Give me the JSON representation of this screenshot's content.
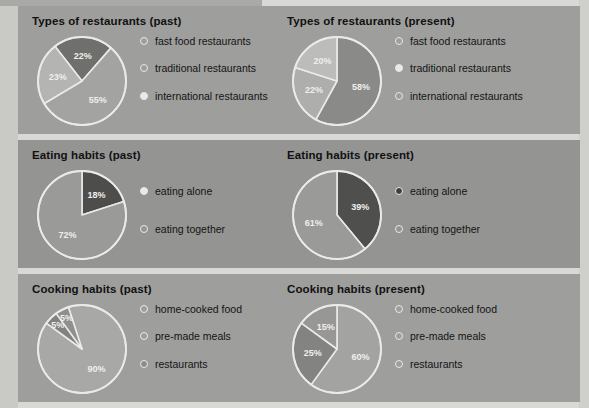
{
  "background": {
    "page_color": "#d8d8d4",
    "panel_color_a": "#9e9e9c",
    "panel_color_b": "#949492",
    "stroke_color": "#eceae6"
  },
  "panels": [
    {
      "id": "types-of-restaurants",
      "charts": [
        {
          "title": "Types of restaurants (past)",
          "chart_data": {
            "type": "pie",
            "title": "Types of restaurants (past)",
            "categories": [
              "fast food restaurants",
              "traditional restaurants",
              "international restaurants"
            ],
            "values": [
              22,
              55,
              23
            ],
            "labels": [
              "22%",
              "55%",
              "23%"
            ],
            "colors": [
              "#6f6f6d",
              "#a3a3a1",
              "#b4b4b2"
            ],
            "legend_position": "right",
            "start_angle_deg": -38
          },
          "legend": [
            {
              "label": "fast food restaurants",
              "marker": "ring"
            },
            {
              "label": "traditional restaurants",
              "marker": "ring"
            },
            {
              "label": "international restaurants",
              "marker": "ring-light"
            }
          ]
        },
        {
          "title": "Types of restaurants (present)",
          "chart_data": {
            "type": "pie",
            "title": "Types of restaurants (present)",
            "categories": [
              "fast food restaurants",
              "traditional restaurants",
              "international restaurants"
            ],
            "values": [
              58,
              22,
              20
            ],
            "labels": [
              "58%",
              "22%",
              "20%"
            ],
            "colors": [
              "#8a8a88",
              "#aeaeac",
              "#bcbcba"
            ],
            "legend_position": "right",
            "start_angle_deg": 0
          },
          "legend": [
            {
              "label": "fast food restaurants",
              "marker": "ring"
            },
            {
              "label": "traditional restaurants",
              "marker": "ring-light"
            },
            {
              "label": "international restaurants",
              "marker": "ring"
            }
          ]
        }
      ]
    },
    {
      "id": "eating-habits",
      "charts": [
        {
          "title": "Eating habits (past)",
          "chart_data": {
            "type": "pie",
            "title": "Eating habits (past)",
            "categories": [
              "eating alone",
              "eating together"
            ],
            "values": [
              18,
              72
            ],
            "labels": [
              "18%",
              "72%"
            ],
            "colors": [
              "#4d4d4b",
              "#9a9a98"
            ],
            "legend_position": "right",
            "start_angle_deg": 0
          },
          "legend": [
            {
              "label": "eating alone",
              "marker": "ring-light"
            },
            {
              "label": "eating together",
              "marker": "ring"
            }
          ]
        },
        {
          "title": "Eating habits (present)",
          "chart_data": {
            "type": "pie",
            "title": "Eating habits (present)",
            "categories": [
              "eating alone",
              "eating together"
            ],
            "values": [
              39,
              61
            ],
            "labels": [
              "39%",
              "61%"
            ],
            "colors": [
              "#4f4f4d",
              "#9a9a98"
            ],
            "legend_position": "right",
            "start_angle_deg": 0
          },
          "legend": [
            {
              "label": "eating alone",
              "marker": "dot-dark"
            },
            {
              "label": "eating together",
              "marker": "ring"
            }
          ]
        }
      ]
    },
    {
      "id": "cooking-habits",
      "charts": [
        {
          "title": "Cooking habits (past)",
          "chart_data": {
            "type": "pie",
            "title": "Cooking habits (past)",
            "categories": [
              "home-cooked food",
              "pre-made meals",
              "restaurants"
            ],
            "values": [
              90,
              5,
              5
            ],
            "labels": [
              "90%",
              "5%",
              "5%"
            ],
            "colors": [
              "#a8a8a6",
              "#828280",
              "#8f8f8d"
            ],
            "legend_position": "right",
            "start_angle_deg": -18
          },
          "legend": [
            {
              "label": "home-cooked food",
              "marker": "ring"
            },
            {
              "label": "pre-made meals",
              "marker": "ring"
            },
            {
              "label": "restaurants",
              "marker": "ring-mid"
            }
          ]
        },
        {
          "title": "Cooking habits (present)",
          "chart_data": {
            "type": "pie",
            "title": "Cooking habits (present)",
            "categories": [
              "home-cooked food",
              "pre-made meals",
              "restaurants"
            ],
            "values": [
              60,
              25,
              15
            ],
            "labels": [
              "60%",
              "25%",
              "15%"
            ],
            "colors": [
              "#a3a3a1",
              "#838381",
              "#979795"
            ],
            "legend_position": "right",
            "start_angle_deg": 0
          },
          "legend": [
            {
              "label": "home-cooked food",
              "marker": "ring"
            },
            {
              "label": "pre-made meals",
              "marker": "ring"
            },
            {
              "label": "restaurants",
              "marker": "ring"
            }
          ]
        }
      ]
    }
  ]
}
